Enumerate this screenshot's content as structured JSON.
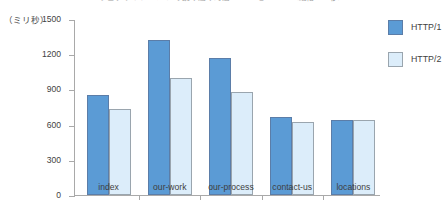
{
  "chart_data": {
    "type": "bar",
    "title": "ウェブサイト5ページの読み込み時間 HTTP/1とHTTP/2（縦軸ミリ秒）",
    "xlabel": "",
    "ylabel": "（ミリ秒）",
    "ylim": [
      0,
      1500
    ],
    "yticks": [
      0,
      300,
      600,
      900,
      1200,
      1500
    ],
    "ytick_labels": [
      "0",
      "300",
      "600",
      "900",
      "1200",
      "1500"
    ],
    "categories": [
      "index",
      "our-work",
      "our-process",
      "contact-us",
      "locations"
    ],
    "series": [
      {
        "name": "HTTP/1",
        "color": "#5b9bd5",
        "values": [
          850,
          1320,
          1170,
          665,
          640
        ]
      },
      {
        "name": "HTTP/2",
        "color": "#dcedfa",
        "values": [
          730,
          1000,
          880,
          620,
          640
        ]
      }
    ],
    "legend_position": "right",
    "grid": false
  }
}
